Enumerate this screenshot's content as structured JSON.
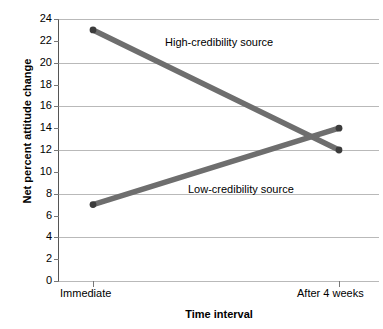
{
  "chart_data": {
    "type": "line",
    "title": "",
    "xlabel": "Time interval",
    "ylabel": "Net percent attitude change",
    "categories": [
      "Immediate",
      "After 4 weeks"
    ],
    "x_tick_labels": [
      "Immediate",
      "After 4 weeks"
    ],
    "y_tick_labels": [
      "0",
      "2",
      "4",
      "6",
      "8",
      "10",
      "12",
      "14",
      "16",
      "18",
      "20",
      "22",
      "24"
    ],
    "y_ticks": [
      0,
      2,
      4,
      6,
      8,
      10,
      12,
      14,
      16,
      18,
      20,
      22,
      24
    ],
    "gridlines_at": [
      0,
      4,
      8,
      12,
      16,
      20,
      24
    ],
    "ylim": [
      0,
      24
    ],
    "grid": true,
    "legend_position": "inline-annotation",
    "series": [
      {
        "name": "High-credibility source",
        "values": [
          23,
          12
        ],
        "color": "#6e6e6e",
        "label_text": "High-credibility source"
      },
      {
        "name": "Low-credibility source",
        "values": [
          7,
          14
        ],
        "color": "#6e6e6e",
        "label_text": "Low-credibility source"
      }
    ],
    "annotations": [
      {
        "text": "High-credibility source",
        "near_series": "High-credibility source"
      },
      {
        "text": "Low-credibility source",
        "near_series": "Low-credibility source"
      }
    ],
    "colors": {
      "line": "#6e6e6e",
      "marker": "#3c3c3c",
      "gridline": "#b9b9b9",
      "axis": "#555555",
      "text": "#000000",
      "background": "#ffffff"
    }
  }
}
